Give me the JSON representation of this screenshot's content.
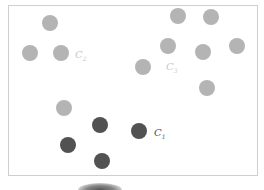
{
  "diagram": {
    "type": "cluster-scatter",
    "colors": {
      "light": "#b4b4b4",
      "dark": "#525252",
      "frame": "#cfcfcf",
      "label_light": "#c8c8c8",
      "label_dark": "#555555"
    },
    "clusters": [
      {
        "name": "C2",
        "label": "C",
        "subscript": "2",
        "label_pos": [
          75,
          50
        ],
        "shade": "light",
        "points": [
          [
            50,
            23
          ],
          [
            30,
            53
          ],
          [
            61,
            53
          ],
          [
            64,
            108
          ]
        ]
      },
      {
        "name": "C3",
        "label": "C",
        "subscript": "3",
        "label_pos": [
          166,
          62
        ],
        "shade": "light",
        "points": [
          [
            178,
            16
          ],
          [
            211,
            17
          ],
          [
            168,
            46
          ],
          [
            203,
            52
          ],
          [
            237,
            46
          ],
          [
            143,
            67
          ],
          [
            207,
            88
          ]
        ]
      },
      {
        "name": "C1",
        "label": "C",
        "subscript": "1",
        "label_pos": [
          154,
          128
        ],
        "shade": "dark",
        "points": [
          [
            100,
            125
          ],
          [
            139,
            131
          ],
          [
            68,
            145
          ],
          [
            102,
            161
          ]
        ]
      }
    ]
  }
}
